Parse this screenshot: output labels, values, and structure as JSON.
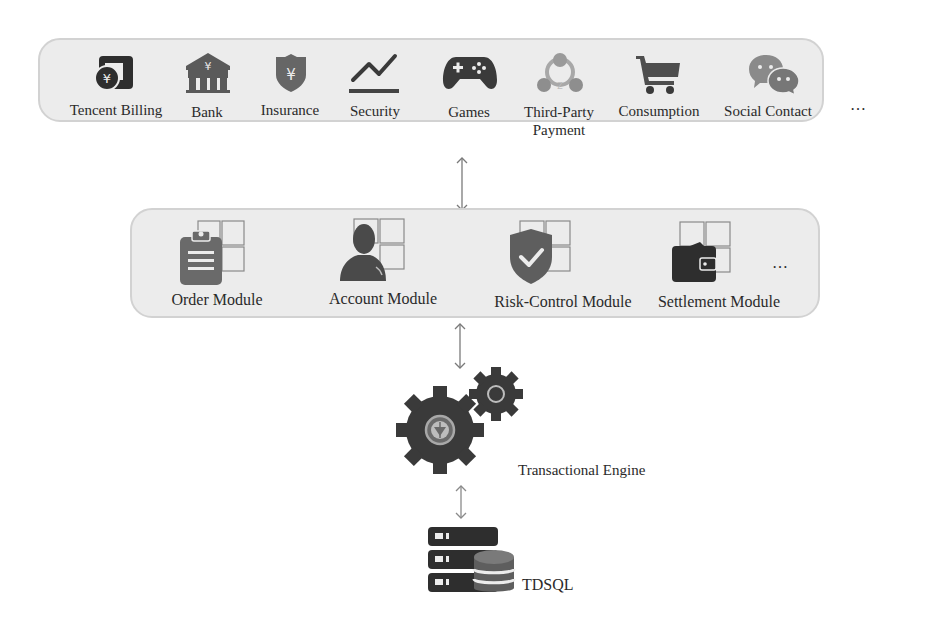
{
  "top_layer": {
    "items": [
      {
        "label": "Tencent Billing",
        "icon": "tencent-billing-icon"
      },
      {
        "label": "Bank",
        "icon": "bank-icon"
      },
      {
        "label": "Insurance",
        "icon": "insurance-icon"
      },
      {
        "label": "Security",
        "icon": "security-chart-icon"
      },
      {
        "label": "Games",
        "icon": "gamepad-icon"
      },
      {
        "label": "Third-Party\nPayment",
        "label_line1": "Third-Party",
        "label_line2": "Payment",
        "icon": "third-party-payment-icon"
      },
      {
        "label": "Consumption",
        "icon": "shopping-cart-icon"
      },
      {
        "label": "Social Contact",
        "icon": "chat-bubbles-icon"
      }
    ],
    "more": "…"
  },
  "module_layer": {
    "items": [
      {
        "label": "Order Module",
        "icon": "clipboard-module-icon"
      },
      {
        "label": "Account Module",
        "icon": "user-module-icon"
      },
      {
        "label": "Risk-Control Module",
        "icon": "shield-check-module-icon"
      },
      {
        "label": "Settlement Module",
        "icon": "wallet-module-icon"
      }
    ],
    "more": "…"
  },
  "engine": {
    "label": "Transactional Engine",
    "icon": "gears-icon"
  },
  "database": {
    "label": "TDSQL",
    "icon": "database-server-icon"
  },
  "colors": {
    "panel_bg": "#ececec",
    "panel_border": "#d2d2d2",
    "icon_dark": "#3a3a3a",
    "icon_mid": "#6e6e6e",
    "icon_light": "#9a9a9a",
    "arrow": "#7a7a7a"
  }
}
